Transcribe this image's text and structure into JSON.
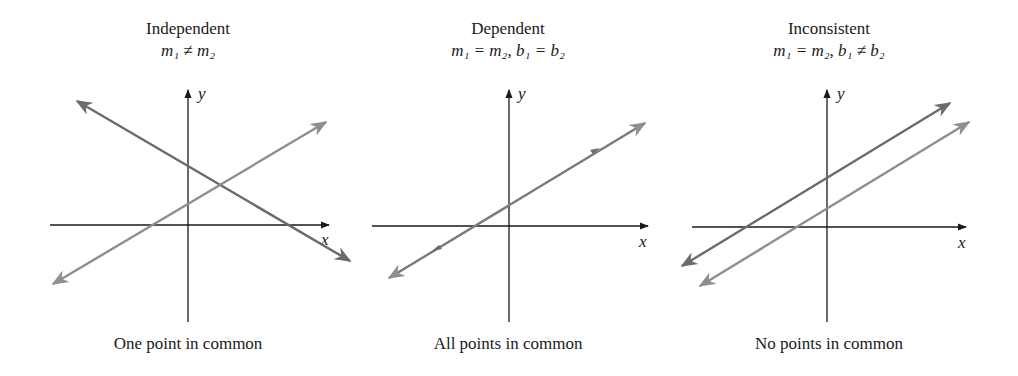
{
  "panels": [
    {
      "title": "Independent",
      "condition": "m₁ ≠ m₂",
      "caption": "One point in common",
      "x_axis_label": "x",
      "y_axis_label": "y"
    },
    {
      "title": "Dependent",
      "condition": "m₁ = m₂, b₁ = b₂",
      "caption": "All points in common",
      "x_axis_label": "x",
      "y_axis_label": "y"
    },
    {
      "title": "Inconsistent",
      "condition": "m₁ = m₂, b₁ ≠ b₂",
      "caption": "No points in common",
      "x_axis_label": "x",
      "y_axis_label": "y"
    }
  ],
  "colors": {
    "axis": "#1a1a1a",
    "line_dark": "#6b6b6b",
    "line_light": "#8e8e8e"
  }
}
